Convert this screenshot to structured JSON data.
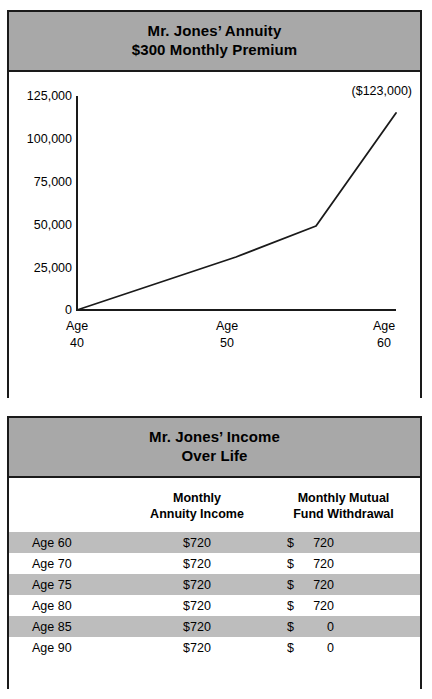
{
  "chart_panel": {
    "header": {
      "line1": "Mr. Jones’ Annuity",
      "line2": "$300 Monthly Premium"
    },
    "annotation": "($123,000)"
  },
  "table_panel": {
    "header": {
      "line1": "Mr. Jones’ Income",
      "line2": "Over Life"
    },
    "columns": [
      {
        "line1": "",
        "line2": ""
      },
      {
        "line1": "Monthly",
        "line2": "Annuity Income"
      },
      {
        "line1": "Monthly Mutual",
        "line2": "Fund Withdrawal"
      }
    ],
    "rows": [
      {
        "age": "Age 60",
        "annuity": "$720",
        "fund_sym": "$",
        "fund_num": "720",
        "shaded": true
      },
      {
        "age": "Age 70",
        "annuity": "$720",
        "fund_sym": "$",
        "fund_num": "720",
        "shaded": false
      },
      {
        "age": "Age 75",
        "annuity": "$720",
        "fund_sym": "$",
        "fund_num": "720",
        "shaded": true
      },
      {
        "age": "Age 80",
        "annuity": "$720",
        "fund_sym": "$",
        "fund_num": "720",
        "shaded": false
      },
      {
        "age": "Age 85",
        "annuity": "$720",
        "fund_sym": "$",
        "fund_num": "0",
        "shaded": true
      },
      {
        "age": "Age 90",
        "annuity": "$720",
        "fund_sym": "$",
        "fund_num": "0",
        "shaded": false
      }
    ]
  },
  "colors": {
    "header_gray": "#a8a8a8",
    "row_gray": "#bdbdbd",
    "ink": "#1a1a1a",
    "paper": "#ffffff"
  },
  "chart_data": {
    "type": "line",
    "xlabel": "",
    "ylabel": "",
    "x": [
      40,
      50,
      55,
      60
    ],
    "values": [
      0,
      33000,
      52000,
      123000
    ],
    "xlim": [
      40,
      60
    ],
    "ylim": [
      0,
      125000
    ],
    "grid": false,
    "legend": null,
    "xtick_labels": [
      "Age 40",
      "Age 50",
      "Age 60"
    ],
    "xticks": [
      40,
      50,
      60
    ],
    "yticks": [
      0,
      25000,
      50000,
      75000,
      100000,
      125000
    ],
    "ytick_labels": [
      "0",
      "25,000",
      "50,000",
      "75,000",
      "100,000",
      "125,000"
    ],
    "annotations": [
      {
        "text": "($123,000)",
        "x": 60,
        "y": 123000
      }
    ],
    "series": [
      {
        "name": "Annuity accumulated value",
        "x": [
          40,
          50,
          55,
          60
        ],
        "values": [
          0,
          33000,
          52000,
          123000
        ]
      }
    ]
  }
}
